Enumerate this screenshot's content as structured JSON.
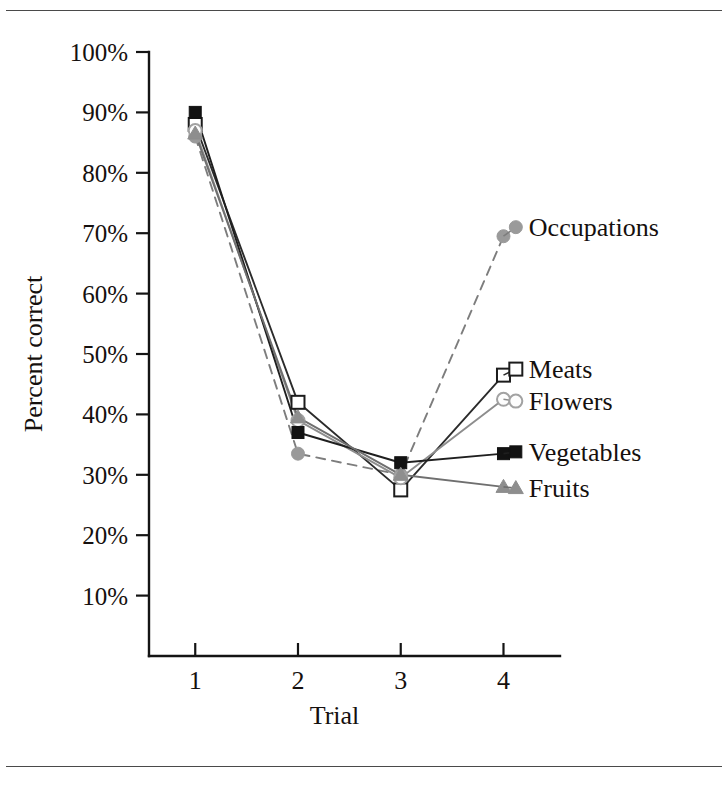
{
  "figure": {
    "has_top_rule": true,
    "has_bottom_rule": true,
    "background": "#ffffff"
  },
  "chart_data": {
    "type": "line",
    "title": "",
    "subtitle": "",
    "xlabel": "Trial",
    "ylabel": "Percent correct",
    "x": [
      1,
      2,
      3,
      4
    ],
    "xtick_labels": [
      "1",
      "2",
      "3",
      "4"
    ],
    "ytick_labels": [
      "10%",
      "20%",
      "30%",
      "40%",
      "50%",
      "60%",
      "70%",
      "80%",
      "90%",
      "100%"
    ],
    "ytick_values": [
      10,
      20,
      30,
      40,
      50,
      60,
      70,
      80,
      90,
      100
    ],
    "ylim": [
      0,
      100
    ],
    "xlim": [
      0.55,
      4.55
    ],
    "grid": false,
    "legend_position": "right-inline-labels",
    "series": [
      {
        "name": "Occupations",
        "values": [
          86.0,
          33.5,
          30.0,
          69.5
        ],
        "marker": "circle-filled-gray",
        "marker_color": "#9a9a9a",
        "line_color": "#7d7d7d",
        "line_style": "dashed",
        "label_x": 4.12,
        "label_y": 71.0
      },
      {
        "name": "Meats",
        "values": [
          88.0,
          42.0,
          27.5,
          46.5
        ],
        "marker": "square-open",
        "marker_color": "#1c1c1c",
        "line_color": "#2b2b2b",
        "line_style": "solid",
        "label_x": 4.12,
        "label_y": 47.5
      },
      {
        "name": "Flowers",
        "values": [
          87.0,
          39.0,
          29.5,
          42.5
        ],
        "marker": "circle-open-gray",
        "marker_color": "#a2a2a2",
        "line_color": "#8d8d8d",
        "line_style": "solid",
        "label_x": 4.12,
        "label_y": 42.2
      },
      {
        "name": "Vegetables",
        "values": [
          90.0,
          37.0,
          32.0,
          33.5
        ],
        "marker": "square-filled-black",
        "marker_color": "#121212",
        "line_color": "#1f1f1f",
        "line_style": "solid",
        "label_x": 4.12,
        "label_y": 33.8
      },
      {
        "name": "Fruits",
        "values": [
          86.5,
          39.5,
          30.0,
          28.0
        ],
        "marker": "triangle-gray",
        "marker_color": "#8e8e8e",
        "line_color": "#6f6f6f",
        "line_style": "solid",
        "label_x": 4.12,
        "label_y": 27.8
      }
    ]
  }
}
